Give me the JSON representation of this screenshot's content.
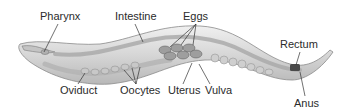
{
  "diagram": {
    "labels": {
      "pharynx": "Pharynx",
      "intestine": "Intestine",
      "eggs": "Eggs",
      "rectum": "Rectum",
      "oviduct": "Oviduct",
      "oocytes": "Oocytes",
      "uterus": "Uterus",
      "vulva": "Vulva",
      "anus": "Anus"
    },
    "colors": {
      "body_fill": "#d9d9d9",
      "body_edge": "#8a8a8a",
      "organ_fill": "#bdbdbd",
      "egg_fill": "#9e9e9e",
      "rectum_fill": "#4a4a4a",
      "leader_line": "#333333",
      "label_text": "#2b2b2b"
    }
  }
}
